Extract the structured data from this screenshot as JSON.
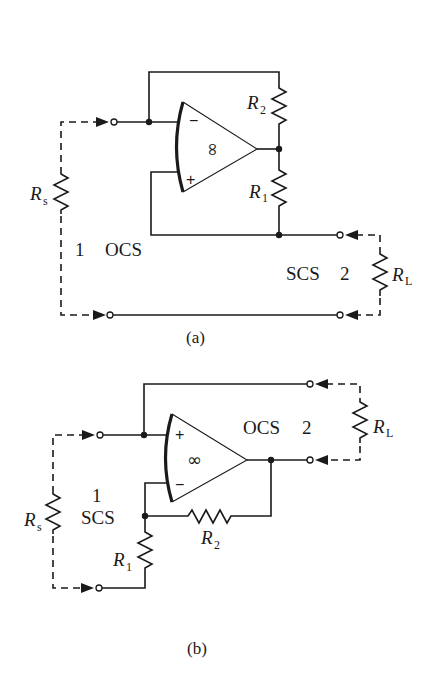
{
  "diagram_a": {
    "caption": "(a)",
    "opamp": {
      "gain_symbol": "∞",
      "inverting_sign": "−",
      "noninverting_sign": "+"
    },
    "resistors": {
      "source": {
        "label": "R",
        "sub": "s"
      },
      "r1": {
        "label": "R",
        "sub": "1"
      },
      "r2": {
        "label": "R",
        "sub": "2"
      },
      "load": {
        "label": "R",
        "sub": "L"
      }
    },
    "port1": {
      "number": "1",
      "type": "OCS"
    },
    "port2": {
      "number": "2",
      "type": "SCS"
    }
  },
  "diagram_b": {
    "caption": "(b)",
    "opamp": {
      "gain_symbol": "∞",
      "inverting_sign": "−",
      "noninverting_sign": "+"
    },
    "resistors": {
      "source": {
        "label": "R",
        "sub": "s"
      },
      "r1": {
        "label": "R",
        "sub": "1"
      },
      "r2": {
        "label": "R",
        "sub": "2"
      },
      "load": {
        "label": "R",
        "sub": "L"
      }
    },
    "port1": {
      "number": "1",
      "type": "SCS"
    },
    "port2": {
      "number": "2",
      "type": "OCS"
    }
  }
}
